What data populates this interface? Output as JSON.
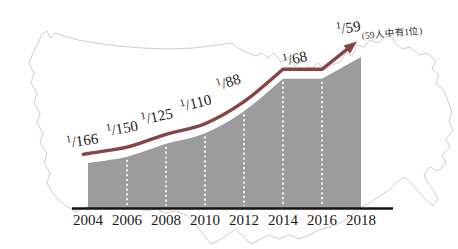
{
  "chart_data": {
    "type": "area",
    "title": "",
    "xlabel": "",
    "ylabel": "",
    "categories": [
      "2004",
      "2006",
      "2008",
      "2010",
      "2012",
      "2014",
      "2016",
      "2018"
    ],
    "series": [
      {
        "name": "prevalence-rate",
        "rate_denominators": [
          166,
          150,
          125,
          110,
          88,
          68,
          68,
          59
        ],
        "values_per_1000": [
          6.0,
          6.7,
          8.0,
          9.1,
          11.4,
          14.7,
          14.7,
          16.9
        ]
      }
    ],
    "point_labels": [
      "1/166",
      "1/150",
      "1/125",
      "1/110",
      "1/88",
      "1/68",
      "1/59"
    ],
    "annotation": "(59人中有1位)",
    "grid": "white dashed vertical dividers between year bands",
    "legend": "none",
    "background_motif": "light outline of continental United States map",
    "trend": "rising curve 2004-2014, plateau 2014-2016 at 1/68, arrow rising to 1/59 at 2018"
  },
  "colors": {
    "area_fill": "#9c9c9c",
    "trend_line": "#874444",
    "map_outline": "#d2cdcd",
    "axis_line": "#141414",
    "label_text": "#1a1a1a",
    "annotation_text": "#2e2e2e",
    "divider_dash": "#ffffff"
  }
}
